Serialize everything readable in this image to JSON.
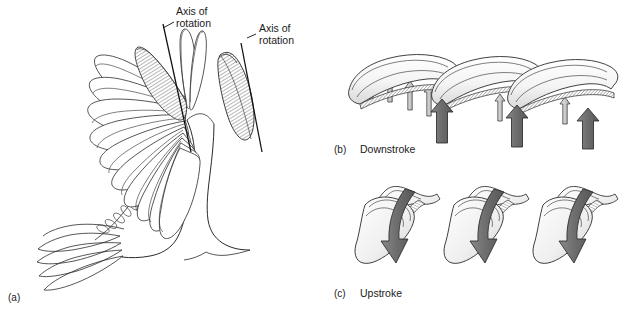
{
  "figure": {
    "background_color": "#ffffff",
    "ink_color": "#2b2b2b",
    "arrow_dark_color": "#6e6e6e",
    "arrow_light_color": "#cfcfcf"
  },
  "panel_a": {
    "letter": "(a)",
    "axis_label_wing": "Axis of\nrotation",
    "axis_label_wing_line1": "Axis of",
    "axis_label_wing_line2": "rotation",
    "axis_label_feather_line1": "Axis of",
    "axis_label_feather_line2": "rotation",
    "description": "Dorsal view of a bird with one wing spread showing fanned primary feathers, the axis of rotation through the feather shafts, and an isolated single primary feather at right."
  },
  "panel_b": {
    "letter": "(b)",
    "caption": "Downstroke",
    "description": "Cross-sections of overlapping primary feathers forming a closed airfoil surface; arrows show air pushed upward against the sealed vanes.",
    "feather_count": 3,
    "large_arrow_count": 3,
    "small_arrow_count": 6,
    "arrow_direction": "up"
  },
  "panel_c": {
    "letter": "(c)",
    "caption": "Upstroke",
    "description": "Feathers rotate and separate so air slips through the gaps between them; curved arrows show air passing downward through the openings.",
    "feather_pair_count": 3,
    "large_arrow_count": 3,
    "arrow_direction": "down"
  }
}
